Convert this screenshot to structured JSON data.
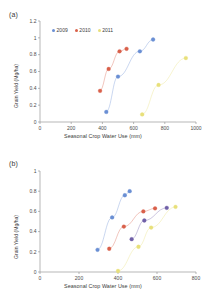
{
  "figure": {
    "panels": [
      {
        "id": "a",
        "label": "(a)",
        "legend_items": [
          {
            "name": "2009",
            "color": "#6a8fd4"
          },
          {
            "name": "2010",
            "color": "#d9604a"
          },
          {
            "name": "2011",
            "color": "#e8e07a"
          }
        ],
        "chart_data": {
          "type": "scatter",
          "title": "",
          "xlabel": "Seasonal Crop Water Use (mm)",
          "ylabel": "Grain Yield (Mg/ha)",
          "xlim": [
            0,
            1000
          ],
          "ylim": [
            0,
            1.2
          ],
          "xticks": [
            0,
            200,
            400,
            600,
            800,
            1000
          ],
          "yticks": [
            0,
            0.2,
            0.4,
            0.6,
            0.8,
            1,
            1.2
          ],
          "xtick_labels": [
            "0",
            "200",
            "400",
            "600",
            "800",
            "1000"
          ],
          "ytick_labels": [
            "0",
            "0.2",
            "0.4",
            "0.6",
            "0.8",
            "1",
            "1.2"
          ],
          "grid": false,
          "legend_position": "top-left",
          "connected": true,
          "series": [
            {
              "name": "2009",
              "color": "#6a8fd4",
              "points": [
                {
                  "x": 425,
                  "y": 0.12
                },
                {
                  "x": 500,
                  "y": 0.54
                },
                {
                  "x": 640,
                  "y": 0.84
                },
                {
                  "x": 725,
                  "y": 0.98
                }
              ]
            },
            {
              "name": "2010",
              "color": "#d9604a",
              "points": [
                {
                  "x": 385,
                  "y": 0.37
                },
                {
                  "x": 440,
                  "y": 0.63
                },
                {
                  "x": 510,
                  "y": 0.84
                },
                {
                  "x": 555,
                  "y": 0.87
                }
              ]
            },
            {
              "name": "2011",
              "color": "#e8e07a",
              "points": [
                {
                  "x": 655,
                  "y": 0.09
                },
                {
                  "x": 760,
                  "y": 0.44
                },
                {
                  "x": 935,
                  "y": 0.76
                }
              ]
            }
          ]
        }
      },
      {
        "id": "b",
        "label": "(b)",
        "legend_items": [
          {
            "name": "2009",
            "color": "#6a8fd4"
          },
          {
            "name": "2010",
            "color": "#d9604a"
          },
          {
            "name": "2011",
            "color": "#e8e07a"
          },
          {
            "name": "2012",
            "color": "#6f5fa8"
          }
        ],
        "chart_data": {
          "type": "scatter",
          "title": "",
          "xlabel": "Seasonal Crop Water Use (mm)",
          "ylabel": "Grain Yield (Mg/ha)",
          "xlim": [
            0,
            800
          ],
          "ylim": [
            0,
            1
          ],
          "xticks": [
            0,
            200,
            400,
            600,
            800
          ],
          "yticks": [
            0,
            0.2,
            0.4,
            0.6,
            0.8,
            1
          ],
          "xtick_labels": [
            "0",
            "200",
            "400",
            "600",
            "800"
          ],
          "ytick_labels": [
            "0",
            "0.2",
            "0.4",
            "0.6",
            "0.8",
            "1"
          ],
          "grid": false,
          "legend_position": "top-left",
          "connected": true,
          "series": [
            {
              "name": "2009",
              "color": "#6a8fd4",
              "points": [
                {
                  "x": 295,
                  "y": 0.22
                },
                {
                  "x": 370,
                  "y": 0.54
                },
                {
                  "x": 435,
                  "y": 0.76
                },
                {
                  "x": 460,
                  "y": 0.8
                }
              ]
            },
            {
              "name": "2010",
              "color": "#d9604a",
              "points": [
                {
                  "x": 355,
                  "y": 0.23
                },
                {
                  "x": 430,
                  "y": 0.45
                },
                {
                  "x": 530,
                  "y": 0.6
                },
                {
                  "x": 590,
                  "y": 0.63
                }
              ]
            },
            {
              "name": "2011",
              "color": "#e8e07a",
              "points": [
                {
                  "x": 400,
                  "y": 0.01
                },
                {
                  "x": 505,
                  "y": 0.25
                },
                {
                  "x": 570,
                  "y": 0.44
                },
                {
                  "x": 695,
                  "y": 0.645
                }
              ]
            },
            {
              "name": "2012",
              "color": "#6f5fa8",
              "points": [
                {
                  "x": 470,
                  "y": 0.325
                },
                {
                  "x": 535,
                  "y": 0.51
                },
                {
                  "x": 650,
                  "y": 0.635
                }
              ]
            }
          ]
        }
      }
    ]
  }
}
